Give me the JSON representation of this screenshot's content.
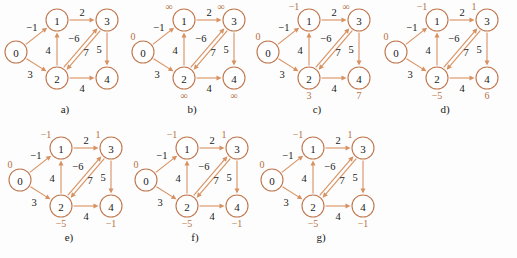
{
  "figure": {
    "accent_color": "#d79161",
    "node_stroke_color": "#c0784e",
    "text_color": "#1a1a1a",
    "dist_color": "#b5713f",
    "background": "#fdfdfd"
  },
  "graph": {
    "nodes": [
      {
        "id": "0",
        "label": "0",
        "x": 16,
        "y": 52
      },
      {
        "id": "1",
        "label": "1",
        "x": 57,
        "y": 20
      },
      {
        "id": "3",
        "label": "3",
        "x": 107,
        "y": 20
      },
      {
        "id": "2",
        "label": "2",
        "x": 57,
        "y": 78
      },
      {
        "id": "4",
        "label": "4",
        "x": 107,
        "y": 78
      }
    ],
    "edges": [
      {
        "from": "0",
        "to": "1",
        "weight": "−1",
        "label_x": 32,
        "label_y": 27
      },
      {
        "from": "0",
        "to": "2",
        "weight": "3",
        "label_x": 30,
        "label_y": 74
      },
      {
        "from": "1",
        "to": "3",
        "weight": "2",
        "label_x": 82,
        "label_y": 12
      },
      {
        "from": "2",
        "to": "1",
        "weight": "4",
        "label_x": 48,
        "label_y": 50
      },
      {
        "from": "3",
        "to": "2",
        "weight": "−6",
        "label_x": 74,
        "label_y": 38
      },
      {
        "from": "2",
        "to": "3",
        "weight": "7",
        "label_x": 86,
        "label_y": 52
      },
      {
        "from": "3",
        "to": "4",
        "weight": "5",
        "label_x": 99,
        "label_y": 49
      },
      {
        "from": "2",
        "to": "4",
        "weight": "4",
        "label_x": 82,
        "label_y": 88
      }
    ]
  },
  "panels": [
    {
      "id": "a",
      "caption": "a)",
      "show_dist": false,
      "dist": {
        "0": "",
        "1": "",
        "2": "",
        "3": "",
        "4": ""
      }
    },
    {
      "id": "b",
      "caption": "b)",
      "show_dist": true,
      "dist": {
        "0": "0",
        "1": "∞",
        "2": "∞",
        "3": "∞",
        "4": "∞"
      }
    },
    {
      "id": "c",
      "caption": "c)",
      "show_dist": true,
      "dist": {
        "0": "0",
        "1": "−1",
        "2": "3",
        "3": "∞",
        "4": "7"
      }
    },
    {
      "id": "d",
      "caption": "d)",
      "show_dist": true,
      "dist": {
        "0": "0",
        "1": "−1",
        "2": "−5",
        "3": "1",
        "4": "6"
      }
    },
    {
      "id": "e",
      "caption": "e)",
      "show_dist": true,
      "dist": {
        "0": "0",
        "1": "−1",
        "2": "−5",
        "3": "1",
        "4": "−1"
      }
    },
    {
      "id": "f",
      "caption": "f)",
      "show_dist": true,
      "dist": {
        "0": "0",
        "1": "−1",
        "2": "−5",
        "3": "1",
        "4": "−1"
      }
    },
    {
      "id": "g",
      "caption": "g)",
      "show_dist": true,
      "dist": {
        "0": "0",
        "1": "−1",
        "2": "−5",
        "3": "1",
        "4": "−1"
      }
    }
  ],
  "layout": {
    "panel_positions": [
      {
        "id": "a",
        "left": 0,
        "top": 0
      },
      {
        "id": "b",
        "left": 127,
        "top": 0
      },
      {
        "id": "c",
        "left": 252,
        "top": 0
      },
      {
        "id": "d",
        "left": 380,
        "top": 0
      },
      {
        "id": "e",
        "left": 4,
        "top": 128
      },
      {
        "id": "f",
        "left": 130,
        "top": 128
      },
      {
        "id": "g",
        "left": 256,
        "top": 128
      }
    ],
    "caption_offsets": [
      {
        "id": "a",
        "left": 0,
        "top": 103
      },
      {
        "id": "b",
        "left": 127,
        "top": 103
      },
      {
        "id": "c",
        "left": 252,
        "top": 103
      },
      {
        "id": "d",
        "left": 380,
        "top": 103
      },
      {
        "id": "e",
        "left": 4,
        "top": 231
      },
      {
        "id": "f",
        "left": 130,
        "top": 231
      },
      {
        "id": "g",
        "left": 256,
        "top": 231
      }
    ]
  }
}
